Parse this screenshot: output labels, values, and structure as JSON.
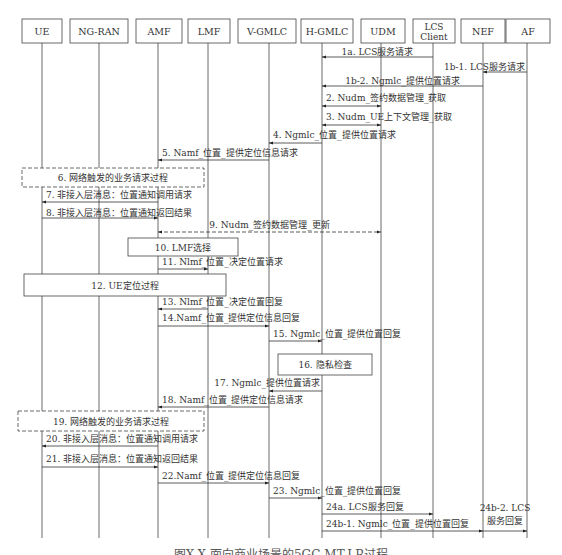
{
  "participants": [
    {
      "id": "UE",
      "label": "UE",
      "x": 42,
      "box": [
        22,
        19,
        40,
        24
      ]
    },
    {
      "id": "NG-RAN",
      "label": "NG-RAN",
      "x": 99,
      "box": [
        70,
        19,
        58,
        24
      ]
    },
    {
      "id": "AMF",
      "label": "AMF",
      "x": 158,
      "box": [
        136,
        19,
        46,
        24
      ]
    },
    {
      "id": "LMF",
      "label": "LMF",
      "x": 208,
      "box": [
        188,
        19,
        42,
        24
      ]
    },
    {
      "id": "V-GMLC",
      "label": "V-GMLC",
      "x": 269,
      "box": [
        238,
        19,
        58,
        24
      ]
    },
    {
      "id": "H-GMLC",
      "label": "H-GMLC",
      "x": 322,
      "box": [
        301,
        19,
        52,
        24
      ]
    },
    {
      "id": "UDM",
      "label": "UDM",
      "x": 381,
      "box": [
        361,
        19,
        44,
        24
      ]
    },
    {
      "id": "LCS Client",
      "label": "LCS Client",
      "lines": [
        "LCS",
        "Client"
      ],
      "x": 433,
      "box": [
        413,
        19,
        42,
        24
      ]
    },
    {
      "id": "NEF",
      "label": "NEF",
      "x": 483,
      "box": [
        461,
        19,
        44,
        24
      ]
    },
    {
      "id": "AF",
      "label": "AF",
      "x": 527,
      "box": [
        506,
        19,
        44,
        24
      ]
    }
  ],
  "messages": [
    {
      "label": "1a. LCS服务请求",
      "from": "LCS Client",
      "to": "H-GMLC",
      "y": 57,
      "ly": 52,
      "style": "solid",
      "align": "center"
    },
    {
      "label": "1b-1. LCS服务请求",
      "from": "AF",
      "to": "NEF",
      "y": 72,
      "ly": 67,
      "style": "solid",
      "align": "right"
    },
    {
      "label": "1b-2. Ngmlc_提供位置请求",
      "from": "NEF",
      "to": "H-GMLC",
      "y": 86,
      "ly": 81,
      "style": "solid",
      "align": "center"
    },
    {
      "label": "2. Nudm_签约数据管理_获取",
      "from": "H-GMLC",
      "to": "UDM",
      "y": 106,
      "ly": 98,
      "style": "both",
      "align": "left"
    },
    {
      "label": "3. Nudm_UE上下文管理_获取",
      "from": "H-GMLC",
      "to": "UDM",
      "y": 125,
      "ly": 117,
      "style": "both",
      "align": "left"
    },
    {
      "label": "4. Ngmlc_位置_提供位置请求",
      "from": "H-GMLC",
      "to": "V-GMLC",
      "y": 143,
      "ly": 135,
      "style": "solid",
      "align": "left"
    },
    {
      "label": "5. Namf_位置_提供定位信息请求",
      "from": "V-GMLC",
      "to": "AMF",
      "y": 160,
      "ly": 153,
      "style": "solid",
      "align": "left"
    },
    {
      "label": "7. 非接入层消息：位置通知调用请求",
      "from": "AMF",
      "to": "UE",
      "y": 202,
      "ly": 195,
      "style": "solid",
      "align": "left"
    },
    {
      "label": "8. 非接入层消息：位置通知返回结果",
      "from": "UE",
      "to": "AMF",
      "y": 218,
      "ly": 213,
      "style": "solid",
      "align": "left"
    },
    {
      "label": "9. Nudm_签约数据管理_更新",
      "from": "AMF",
      "to": "UDM",
      "y": 232,
      "ly": 225,
      "style": "dashed-both",
      "align": "center"
    },
    {
      "label": "11. Nlmf_位置_决定位置请求",
      "from": "AMF",
      "to": "LMF",
      "y": 269,
      "ly": 262,
      "style": "solid",
      "align": "left"
    },
    {
      "label": "13. Nlmf_位置_决定位置回复",
      "from": "LMF",
      "to": "AMF",
      "y": 309,
      "ly": 302,
      "style": "solid",
      "align": "left"
    },
    {
      "label": "14.Namf_位置_提供定位信息回复",
      "from": "AMF",
      "to": "V-GMLC",
      "y": 326,
      "ly": 318,
      "style": "solid",
      "align": "left"
    },
    {
      "label": "15. Ngmlc_位置_提供位置回复",
      "from": "V-GMLC",
      "to": "H-GMLC",
      "y": 341,
      "ly": 334,
      "style": "solid",
      "align": "left"
    },
    {
      "label": "17. Ngmlc_提供位置请求",
      "from": "H-GMLC",
      "to": "V-GMLC",
      "y": 391,
      "ly": 383,
      "style": "solid",
      "align": "right"
    },
    {
      "label": "18. Namf_位置_提供定位信息请求",
      "from": "V-GMLC",
      "to": "AMF",
      "y": 407,
      "ly": 400,
      "style": "solid",
      "align": "left"
    },
    {
      "label": "20. 非接入层消息：位置通知调用请求",
      "from": "AMF",
      "to": "UE",
      "y": 446,
      "ly": 439,
      "style": "solid",
      "align": "left"
    },
    {
      "label": "21. 非接入层消息：位置通知返回结果",
      "from": "UE",
      "to": "AMF",
      "y": 467,
      "ly": 459,
      "style": "solid",
      "align": "left"
    },
    {
      "label": "22.Namf_位置_提供定位信息回复",
      "from": "AMF",
      "to": "V-GMLC",
      "y": 483,
      "ly": 476,
      "style": "solid",
      "align": "left"
    },
    {
      "label": "23. Ngmlc_位置_提供位置回复",
      "from": "V-GMLC",
      "to": "H-GMLC",
      "y": 498,
      "ly": 491,
      "style": "solid",
      "align": "left"
    },
    {
      "label": "24a. LCS服务回复",
      "from": "H-GMLC",
      "to": "LCS Client",
      "y": 514,
      "ly": 507,
      "style": "solid",
      "align": "left"
    },
    {
      "label": "24b-1. Ngmlc_位置_提供位置回复",
      "from": "H-GMLC",
      "to": "NEF",
      "y": 531,
      "ly": 524,
      "style": "solid",
      "align": "left"
    },
    {
      "label": "24b-2. LCS 服务回复",
      "lines": [
        "24b-2. LCS",
        "服务回复"
      ],
      "from": "NEF",
      "to": "AF",
      "y": 531,
      "ly": 508,
      "style": "solid",
      "align": "center"
    }
  ],
  "processes": [
    {
      "label": "6. 网络触发的业务请求过程",
      "x": 22,
      "y": 168,
      "w": 182,
      "h": 19,
      "style": "dashed"
    },
    {
      "label": "10. LMF选择",
      "x": 128,
      "y": 238,
      "w": 110,
      "h": 18,
      "style": "solid"
    },
    {
      "label": "12. UE定位过程",
      "x": 24,
      "y": 274,
      "w": 202,
      "h": 22,
      "style": "solid"
    },
    {
      "label": "16. 隐私检查",
      "x": 278,
      "y": 354,
      "w": 94,
      "h": 21,
      "style": "solid"
    },
    {
      "label": "19. 网络触发的业务请求过程",
      "x": 18,
      "y": 411,
      "w": 186,
      "h": 20,
      "style": "dashed"
    }
  ],
  "caption": "图X-X  面向商业场景的5GC-MT-LR过程",
  "lifeline_bottom": 538
}
